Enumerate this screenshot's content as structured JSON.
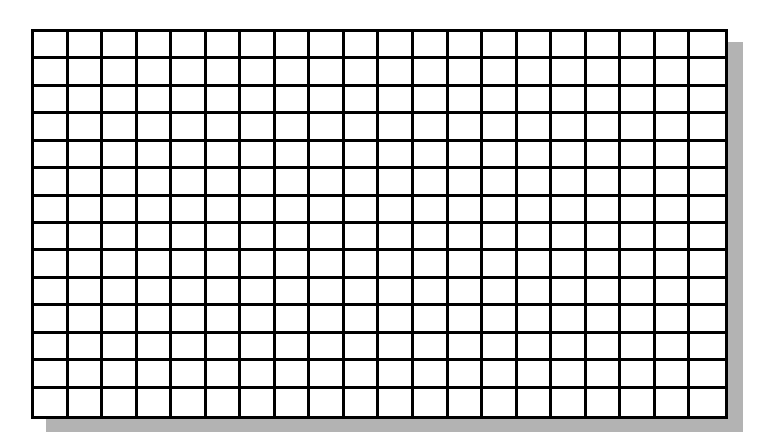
{
  "grid": {
    "columns": 20,
    "rows": 14,
    "line_color": "#000000",
    "cell_color": "#ffffff",
    "shadow_color": "#b3b3b3",
    "shadow_offset_px": 15
  }
}
